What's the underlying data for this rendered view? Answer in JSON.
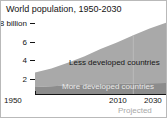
{
  "chart_data": {
    "type": "area",
    "stacked": true,
    "title": "World population, 1950-2030",
    "xlabel": "",
    "ylabel": "",
    "ylim": [
      0,
      8.6
    ],
    "xlim": [
      1950,
      2030
    ],
    "grid": false,
    "legend_position": "inline-labels",
    "y_unit": "billion",
    "y_ticks": [
      {
        "value": 8,
        "label": "8 billion"
      },
      {
        "value": 6,
        "label": "6"
      },
      {
        "value": 4,
        "label": "4"
      },
      {
        "value": 2,
        "label": "2"
      }
    ],
    "x_ticks": [
      {
        "value": 1950,
        "label": "1950"
      },
      {
        "value": 2010,
        "label": "2010"
      },
      {
        "value": 2030,
        "label": "2030"
      }
    ],
    "x": [
      1950,
      1960,
      1970,
      1980,
      1990,
      2000,
      2010,
      2020,
      2030
    ],
    "series": [
      {
        "name": "More developed countries",
        "color": "#8c8c8c",
        "values": [
          0.81,
          0.92,
          1.01,
          1.08,
          1.15,
          1.19,
          1.24,
          1.27,
          1.29
        ]
      },
      {
        "name": "Less developed countries",
        "color": "#a9a9a9",
        "values": [
          1.72,
          2.09,
          2.66,
          3.34,
          4.14,
          4.89,
          5.67,
          6.45,
          7.11
        ]
      }
    ],
    "totals": [
      2.53,
      3.01,
      3.67,
      4.42,
      5.29,
      6.08,
      6.91,
      7.72,
      8.4
    ],
    "annotations": [
      {
        "name": "projected",
        "text": "Projected",
        "from_x": 2010,
        "to_x": 2030,
        "color": "#a8a8a8"
      }
    ]
  },
  "chart": {
    "title": "World population, 1950-2030",
    "y_axis": {
      "tick_top": "8 billion",
      "tick_2": "6",
      "tick_3": "4",
      "tick_4": "2"
    },
    "x_axis": {
      "tick_start": "1950",
      "tick_mid": "2010",
      "tick_end": "2030"
    },
    "labels": {
      "less_developed": "Less developed countries",
      "more_developed": "More developed countries",
      "projected": "Projected"
    },
    "colors": {
      "less_developed_fill": "#a9a9a9",
      "more_developed_fill": "#8c8c8c",
      "axis": "#141414",
      "projected_text": "#a8a8a8",
      "frame": "#b9b9b9"
    }
  }
}
